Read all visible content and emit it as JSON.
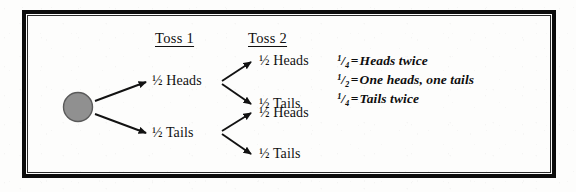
{
  "diagram": {
    "title_columns": [
      {
        "label": "Toss 1"
      },
      {
        "label": "Toss 2"
      }
    ],
    "root_node": {
      "name": "start-coin",
      "color": "#8f8f8f",
      "outline": "#4a4a4a"
    },
    "branches_level1": [
      {
        "label": "½ Heads",
        "outcome": "Heads",
        "probability": "½"
      },
      {
        "label": "½ Tails",
        "outcome": "Tails",
        "probability": "½"
      }
    ],
    "branches_level2": [
      {
        "label": "½ Heads",
        "outcome": "Heads",
        "probability": "½",
        "parent": "Heads"
      },
      {
        "label": "½ Tails",
        "outcome": "Tails",
        "probability": "½",
        "parent": "Heads"
      },
      {
        "label": "½ Heads",
        "outcome": "Heads",
        "probability": "½",
        "parent": "Tails"
      },
      {
        "label": "½ Tails",
        "outcome": "Tails",
        "probability": "½",
        "parent": "Tails"
      }
    ],
    "legend": [
      {
        "fraction": "¹/₄",
        "equals": "=",
        "text": "Heads twice"
      },
      {
        "fraction": "¹/₂",
        "equals": "=",
        "text": "One heads, one tails"
      },
      {
        "fraction": "¹/₄",
        "equals": "=",
        "text": "Tails twice"
      }
    ],
    "colors": {
      "ink": "#111111",
      "frame": "#0c0c0c",
      "node_fill": "#8f8f8f",
      "paper": "#fdfdfc"
    }
  }
}
